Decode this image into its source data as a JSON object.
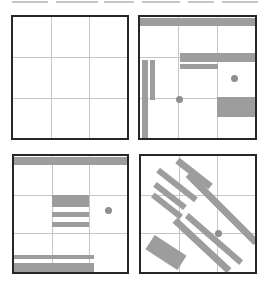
{
  "figure": {
    "name": "four-panel-pattern-figure",
    "background": "#ffffff",
    "panel_border_color": "#262626",
    "panel_border_width": 2,
    "grid_color": "#c6c6c6",
    "shape_color": "#9d9d9d",
    "dot_color": "#8f8f8f",
    "artifact_color": "#c9c6c2",
    "artifact_dashes": [
      {
        "x": 12,
        "w": 36
      },
      {
        "x": 56,
        "w": 42
      },
      {
        "x": 104,
        "w": 30
      },
      {
        "x": 142,
        "w": 38
      },
      {
        "x": 188,
        "w": 26
      },
      {
        "x": 222,
        "w": 36
      }
    ],
    "panels": [
      {
        "id": "panel-top-left",
        "x": 11,
        "y": 15,
        "w": 118,
        "h": 125,
        "shapes": []
      },
      {
        "id": "panel-top-right",
        "x": 138,
        "y": 15,
        "w": 119,
        "h": 125,
        "shapes": [
          {
            "type": "rect",
            "name": "top-bar",
            "x": 0,
            "y": 1,
            "w": 115,
            "h": 8
          },
          {
            "type": "rect",
            "name": "left-vertical-bar",
            "x": 2,
            "y": 43,
            "w": 6,
            "h": 78
          },
          {
            "type": "rect",
            "name": "inner-vertical-bar",
            "x": 10,
            "y": 43,
            "w": 5,
            "h": 40
          },
          {
            "type": "rect",
            "name": "middle-bar-long",
            "x": 40,
            "y": 36,
            "w": 75,
            "h": 9
          },
          {
            "type": "rect",
            "name": "middle-bar-short",
            "x": 40,
            "y": 47,
            "w": 38,
            "h": 5
          },
          {
            "type": "rect",
            "name": "bottom-right-block",
            "x": 77,
            "y": 80,
            "w": 38,
            "h": 20
          },
          {
            "type": "dot",
            "name": "dot-right-cell",
            "cx": 94,
            "cy": 61,
            "r": 3.5
          },
          {
            "type": "dot",
            "name": "dot-grid-intersection",
            "cx": 39,
            "cy": 82,
            "r": 3.5
          }
        ]
      },
      {
        "id": "panel-bottom-left",
        "x": 12,
        "y": 154,
        "w": 117,
        "h": 120,
        "shapes": [
          {
            "type": "rect",
            "name": "top-bar",
            "x": 0,
            "y": 1,
            "w": 113,
            "h": 8
          },
          {
            "type": "rect",
            "name": "center-thick-bar",
            "x": 38,
            "y": 39,
            "w": 37,
            "h": 12
          },
          {
            "type": "rect",
            "name": "center-thin-bar-1",
            "x": 38,
            "y": 56,
            "w": 37,
            "h": 5
          },
          {
            "type": "rect",
            "name": "center-thin-bar-2",
            "x": 38,
            "y": 66,
            "w": 37,
            "h": 5
          },
          {
            "type": "rect",
            "name": "bottom-thin-bar",
            "x": 0,
            "y": 99,
            "w": 80,
            "h": 4
          },
          {
            "type": "rect",
            "name": "bottom-thick-bar",
            "x": 0,
            "y": 107,
            "w": 80,
            "h": 9
          },
          {
            "type": "dot",
            "name": "dot-right-cell",
            "cx": 94,
            "cy": 54,
            "r": 3.5
          }
        ]
      },
      {
        "id": "panel-bottom-right",
        "x": 139,
        "y": 154,
        "w": 118,
        "h": 120,
        "shapes": [
          {
            "type": "dbar",
            "name": "diagonal-bar-short-1",
            "cx": 36,
            "cy": 29,
            "len": 48,
            "th": 6,
            "angle": 38
          },
          {
            "type": "dbar",
            "name": "diagonal-bar-short-2",
            "cx": 29,
            "cy": 40,
            "len": 38,
            "th": 6,
            "angle": 38
          },
          {
            "type": "dbar",
            "name": "diagonal-bar-short-3",
            "cx": 26,
            "cy": 50,
            "len": 36,
            "th": 6,
            "angle": 38
          },
          {
            "type": "dbar",
            "name": "diagonal-bar-medium-top",
            "cx": 53,
            "cy": 17,
            "len": 42,
            "th": 7,
            "angle": 38
          },
          {
            "type": "dbar",
            "name": "diagonal-bar-long-main",
            "cx": 81,
            "cy": 52,
            "len": 96,
            "th": 7,
            "angle": 45
          },
          {
            "type": "dbar",
            "name": "diagonal-bar-long-lower-1",
            "cx": 61,
            "cy": 89,
            "len": 74,
            "th": 7,
            "angle": 43
          },
          {
            "type": "dbar",
            "name": "diagonal-bar-long-lower-2",
            "cx": 73,
            "cy": 83,
            "len": 72,
            "th": 6,
            "angle": 41
          },
          {
            "type": "dbar",
            "name": "rotated-block",
            "cx": 25,
            "cy": 96,
            "len": 38,
            "th": 17,
            "angle": 33
          },
          {
            "type": "dot",
            "name": "dot-grid-intersection",
            "cx": 77,
            "cy": 77,
            "r": 3.5
          }
        ]
      }
    ]
  }
}
